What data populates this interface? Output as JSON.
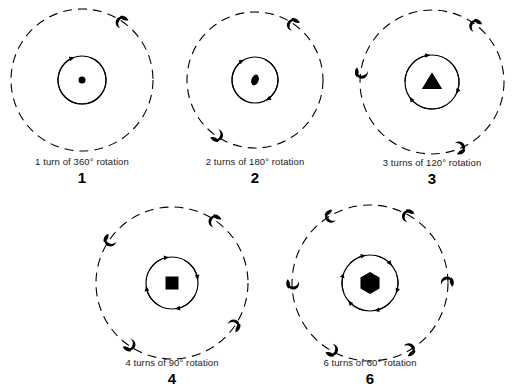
{
  "page": {
    "background_color": "#ffffff",
    "ink_color": "#000000",
    "width": 521,
    "height": 388
  },
  "figures": [
    {
      "id": "figure-1",
      "number": "1",
      "caption": "1 turn of 360° rotation",
      "order": 1,
      "turns": 1,
      "angle_degrees": 360,
      "center_shape": "dot",
      "center_shape_name": "circle-dot",
      "outer_markers": 1,
      "inner_arrows": 1,
      "cx": 82,
      "cy": 80,
      "outer_r": 71,
      "inner_r": 24,
      "center_size": 7,
      "marker_angles": [
        -55
      ],
      "arrow_spans": [
        [
          -70,
          250
        ]
      ],
      "caption_x": 82,
      "caption_y": 156,
      "num_x": 82,
      "num_y": 170
    },
    {
      "id": "figure-2",
      "number": "2",
      "caption": "2 turns of 180° rotation",
      "order": 2,
      "turns": 2,
      "angle_degrees": 180,
      "center_shape": "ellipse",
      "center_shape_name": "ellipse-marker",
      "outer_markers": 2,
      "inner_arrows": 2,
      "cx": 255,
      "cy": 80,
      "outer_r": 68,
      "inner_r": 23,
      "center_size": 9,
      "marker_angles": [
        -55,
        125
      ],
      "arrow_spans": [
        [
          -65,
          60
        ],
        [
          115,
          240
        ]
      ],
      "caption_x": 255,
      "caption_y": 156,
      "num_x": 255,
      "num_y": 170
    },
    {
      "id": "figure-3",
      "number": "3",
      "caption": "3 turns of 120° rotation",
      "order": 3,
      "turns": 3,
      "angle_degrees": 120,
      "center_shape": "triangle",
      "center_shape_name": "triangle-marker",
      "outer_markers": 3,
      "inner_arrows": 3,
      "cx": 432,
      "cy": 82,
      "outer_r": 72,
      "inner_r": 27,
      "center_size": 17,
      "marker_angles": [
        -52,
        68,
        188
      ],
      "arrow_spans": [
        [
          -60,
          25
        ],
        [
          60,
          145
        ],
        [
          180,
          265
        ]
      ],
      "caption_x": 432,
      "caption_y": 157,
      "num_x": 432,
      "num_y": 171
    },
    {
      "id": "figure-4",
      "number": "4",
      "caption": "4 turns of 90° rotation",
      "order": 4,
      "turns": 4,
      "angle_degrees": 90,
      "center_shape": "square",
      "center_shape_name": "square-marker",
      "outer_markers": 4,
      "inner_arrows": 4,
      "cx": 172,
      "cy": 283,
      "outer_r": 76,
      "inner_r": 26,
      "center_size": 13,
      "marker_angles": [
        -55,
        35,
        125,
        215
      ],
      "arrow_spans": [
        [
          -62,
          -8
        ],
        [
          28,
          82
        ],
        [
          118,
          172
        ],
        [
          208,
          262
        ]
      ],
      "caption_x": 172,
      "caption_y": 357,
      "num_x": 172,
      "num_y": 371
    },
    {
      "id": "figure-6",
      "number": "6",
      "caption": "6 turns of 60° rotation",
      "order": 5,
      "turns": 6,
      "angle_degrees": 60,
      "center_shape": "hexagon",
      "center_shape_name": "hexagon-marker",
      "outer_markers": 6,
      "inner_arrows": 6,
      "cx": 370,
      "cy": 283,
      "outer_r": 78,
      "inner_r": 28,
      "center_size": 11,
      "marker_angles": [
        -60,
        -120,
        0,
        60,
        120,
        180
      ],
      "arrow_spans": [
        [
          -75,
          -40
        ],
        [
          -15,
          20
        ],
        [
          45,
          80
        ],
        [
          105,
          140
        ],
        [
          165,
          200
        ],
        [
          225,
          260
        ]
      ],
      "caption_x": 370,
      "caption_y": 357,
      "num_x": 370,
      "num_y": 371
    }
  ]
}
